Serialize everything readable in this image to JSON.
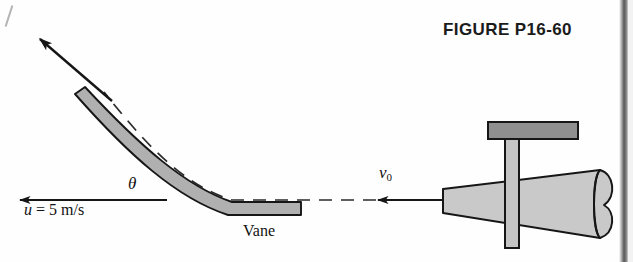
{
  "figure": {
    "title": "FIGURE P16-60",
    "caption_id": "P16-60"
  },
  "labels": {
    "inlet_velocity": "v",
    "inlet_velocity_sub": "0",
    "angle": "θ",
    "vane_velocity": "u = 5 m/s",
    "vane_velocity_symbol": "u",
    "vane_velocity_value": "= 5 m/s",
    "vane": "Vane"
  },
  "colors": {
    "background": "#fefefe",
    "outline": "#161616",
    "vane_fill": "#b0b0b0",
    "nozzle_fill": "#c9c9c9",
    "plate_fill": "#8f8f8f",
    "post_fill": "#c4c4c4",
    "text": "#111111",
    "dashed_line": "#2a2a2a",
    "scan_edge": "#4a4a4a"
  },
  "geometry": {
    "canvas_width": 633,
    "canvas_height": 262,
    "vane_angle_deg": 45,
    "deflection_arrow": {
      "from_x": 175,
      "from_y": 168,
      "to_x": 34,
      "to_y": 33
    },
    "jet_arrow": {
      "from_x": 443,
      "from_y": 200,
      "to_x": 165,
      "to_y": 200
    },
    "u_arrow": {
      "from_x": 167,
      "from_y": 200,
      "to_x": 12,
      "to_y": 200
    },
    "nozzle": {
      "left_x": 443,
      "right_x": 612,
      "top_left_y": 188,
      "bottom_left_y": 214,
      "top_right_y": 170,
      "bottom_right_y": 239
    },
    "support_post": {
      "x": 510,
      "top_y": 138,
      "bottom_y": 247,
      "width": 14
    },
    "top_plate": {
      "x": 488,
      "y": 122,
      "width": 90,
      "height": 18
    },
    "vane_bar": {
      "tip_x": 75,
      "tip_y": 95,
      "end_x": 301,
      "end_y": 215,
      "thickness": 13
    }
  },
  "elements": {
    "dashed_jet_path": "dashed streamline from nozzle along vane surface",
    "arrow_style": "solid filled triangular heads"
  }
}
